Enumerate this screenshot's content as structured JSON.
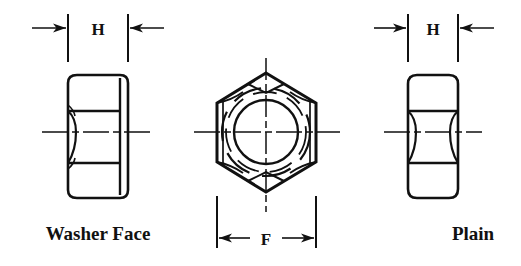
{
  "drawing": {
    "title": "Hex Nut Dimension Drawing",
    "line_color": "#111111",
    "background": "#ffffff",
    "views": [
      {
        "id": "washer-face",
        "label": "Washer Face",
        "position": "left",
        "dimension_label": "H",
        "description": "side elevation of hex nut with washer face"
      },
      {
        "id": "hexagon",
        "label": "",
        "position": "center",
        "dimension_label": "F",
        "description": "end view hexagon with threaded bore"
      },
      {
        "id": "plain",
        "label": "Plain",
        "position": "right",
        "dimension_label": "H",
        "description": "side elevation of plain hex nut"
      }
    ],
    "dimensions": [
      {
        "id": "h-left",
        "label": "H"
      },
      {
        "id": "f-center",
        "label": "F"
      },
      {
        "id": "h-right",
        "label": "H"
      }
    ]
  }
}
